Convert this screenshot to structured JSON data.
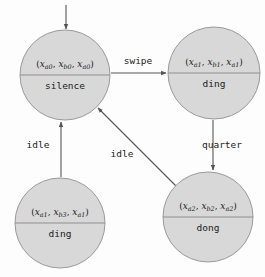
{
  "diagram": {
    "type": "state-machine",
    "canvas": {
      "width": 265,
      "height": 277
    },
    "colors": {
      "node_fill": "#d8d8d8",
      "node_stroke": "#9a9a9a",
      "edge_stroke": "#555555",
      "text": "#1a1a1a",
      "background": "#fdfdfd"
    },
    "initial_marker": {
      "name": "initial-state-arrow",
      "target": "silence"
    },
    "nodes": [
      {
        "id": "silence",
        "tuple": "(x_a0, x_b0, x_a0)",
        "tuple_parts": [
          {
            "var": "x",
            "sub": "a0"
          },
          {
            "var": "x",
            "sub": "b0"
          },
          {
            "var": "x",
            "sub": "a0"
          }
        ],
        "label": "silence",
        "cx": 65,
        "cy": 75,
        "r": 45
      },
      {
        "id": "ding-top",
        "tuple": "(x_a1, x_b1, x_a1)",
        "tuple_parts": [
          {
            "var": "x",
            "sub": "a1"
          },
          {
            "var": "x",
            "sub": "b1"
          },
          {
            "var": "x",
            "sub": "a1"
          }
        ],
        "label": "ding",
        "cx": 214,
        "cy": 73,
        "r": 46
      },
      {
        "id": "ding-bottom",
        "tuple": "(x_a1, x_b3, x_a1)",
        "tuple_parts": [
          {
            "var": "x",
            "sub": "a1"
          },
          {
            "var": "x",
            "sub": "b3"
          },
          {
            "var": "x",
            "sub": "a1"
          }
        ],
        "label": "ding",
        "cx": 60,
        "cy": 223,
        "r": 45
      },
      {
        "id": "dong",
        "tuple": "(x_a2, x_b2, x_a2)",
        "tuple_parts": [
          {
            "var": "x",
            "sub": "a2"
          },
          {
            "var": "x",
            "sub": "b2"
          },
          {
            "var": "x",
            "sub": "a2"
          }
        ],
        "label": "dong",
        "cx": 208,
        "cy": 217,
        "r": 45
      }
    ],
    "edges": [
      {
        "id": "silence-to-ding-top",
        "label": "swipe",
        "from": "silence",
        "to": "ding-top"
      },
      {
        "id": "ding-top-to-dong",
        "label": "quarter",
        "from": "ding-top",
        "to": "dong"
      },
      {
        "id": "ding-bottom-to-silence",
        "label": "idle",
        "from": "ding-bottom",
        "to": "silence"
      },
      {
        "id": "dong-to-silence",
        "label": "idle",
        "from": "dong",
        "to": "silence"
      }
    ]
  }
}
